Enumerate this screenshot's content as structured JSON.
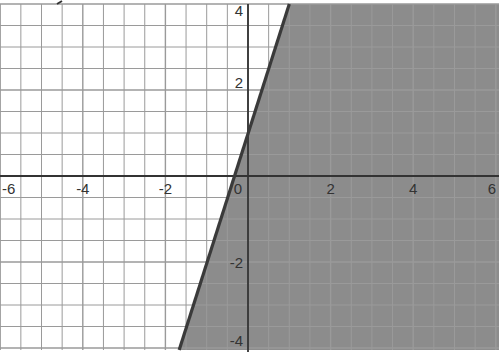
{
  "chart_data": {
    "type": "area",
    "title": "",
    "subtitle": "",
    "xlabel": "",
    "ylabel": "y",
    "xlim": [
      -6,
      6
    ],
    "ylim": [
      -4,
      4
    ],
    "grid": true,
    "grid_step": 0.5,
    "legend": null,
    "x_ticks": [
      -6,
      -4,
      -2,
      0,
      2,
      4,
      6
    ],
    "x_tick_labels": [
      "-6",
      "-4",
      "-2",
      "0",
      "2",
      "4",
      "6"
    ],
    "y_ticks": [
      -4,
      -2,
      2,
      4
    ],
    "y_tick_labels": [
      "-4",
      "-2",
      "2",
      "4"
    ],
    "series": [
      {
        "name": "boundary line y = 3x + 1",
        "kind": "line",
        "style": "solid",
        "slope": 3,
        "intercept": 1,
        "points": [
          [
            -1.667,
            -4
          ],
          [
            0,
            1
          ],
          [
            1,
            4
          ]
        ]
      },
      {
        "name": "shaded region (right of line)",
        "kind": "region",
        "inequality": "y <= 3x + 1",
        "fill": "#8c8c8c"
      }
    ]
  },
  "colors": {
    "background": "#ffffff",
    "grid": "#9a9a9a",
    "axis": "#333333",
    "shade": "#8c8c8c",
    "boundary": "#3a3a3a"
  }
}
